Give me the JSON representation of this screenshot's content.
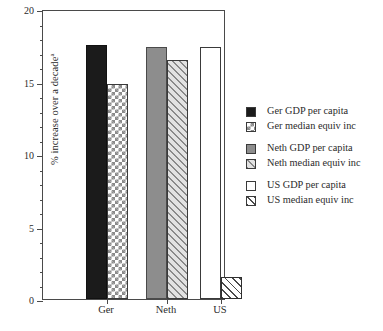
{
  "chart_data": {
    "type": "bar",
    "title": "",
    "xlabel": "",
    "ylabel": "% increase over a decade",
    "ylabel_superscript": "a",
    "ylim": [
      0,
      20
    ],
    "yticks": [
      0,
      5,
      10,
      15,
      20
    ],
    "ytick_labels": [
      "0",
      "5",
      "10",
      "15",
      "20"
    ],
    "minor_tick_step": 1,
    "grid": false,
    "legend_position": "right",
    "categories": [
      "Ger",
      "Neth",
      "US"
    ],
    "series": [
      {
        "name": "Ger GDP per capita",
        "category": "Ger",
        "value": 17.5,
        "fill": "solid-black",
        "color": "#1b1b1b"
      },
      {
        "name": "Ger median equiv inc",
        "category": "Ger",
        "value": 14.8,
        "fill": "checker",
        "color": "#8a8a8a"
      },
      {
        "name": "Neth GDP per capita",
        "category": "Neth",
        "value": 17.4,
        "fill": "solid-gray",
        "color": "#8d8d8d"
      },
      {
        "name": "Neth median equiv inc",
        "category": "Neth",
        "value": 16.5,
        "fill": "hatch-gray",
        "color": "#8a8a8a"
      },
      {
        "name": "US GDP per capita",
        "category": "US",
        "value": 17.4,
        "fill": "empty",
        "color": "#ffffff"
      },
      {
        "name": "US median equiv inc",
        "category": "US",
        "value": 1.5,
        "fill": "hatch-white",
        "color": "#4a4a4a"
      }
    ]
  },
  "axis": {
    "y_title": "% increase over a decade",
    "y_title_superscript": "a",
    "tick_0": "0",
    "tick_5": "5",
    "tick_10": "10",
    "tick_15": "15",
    "tick_20": "20"
  },
  "categories": {
    "ger": "Ger",
    "neth": "Neth",
    "us": "US"
  },
  "legend": {
    "groups": [
      {
        "rows": [
          {
            "label": "Ger GDP per capita",
            "fill": "solid-black"
          },
          {
            "label": "Ger median equiv inc",
            "fill": "checker"
          }
        ]
      },
      {
        "rows": [
          {
            "label": "Neth GDP per capita",
            "fill": "solid-gray"
          },
          {
            "label": "Neth median equiv inc",
            "fill": "hatch-gray"
          }
        ]
      },
      {
        "rows": [
          {
            "label": "US GDP per capita",
            "fill": "empty"
          },
          {
            "label": "US median equiv inc",
            "fill": "hatch-white"
          }
        ]
      }
    ]
  }
}
